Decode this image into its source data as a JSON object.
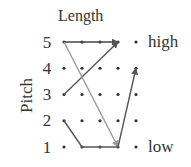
{
  "diagram": {
    "title": "Length",
    "y_axis_label": "Pitch",
    "y_ticks": [
      "5",
      "4",
      "3",
      "2",
      "1"
    ],
    "high_label": "high",
    "low_label": "low",
    "grid": {
      "columns": 5,
      "rows": 5
    },
    "paths": [
      {
        "name": "path-top-row",
        "color": "#444444",
        "points": [
          [
            1,
            5
          ],
          [
            2,
            5
          ],
          [
            3,
            5
          ],
          [
            4,
            5
          ]
        ],
        "arrow": true
      },
      {
        "name": "path-3-to-4-5",
        "color": "#555555",
        "points": [
          [
            1,
            3
          ],
          [
            4,
            5
          ]
        ],
        "arrow": true
      },
      {
        "name": "path-5-to-4-1",
        "color": "#999999",
        "points": [
          [
            1,
            5
          ],
          [
            4,
            1
          ]
        ],
        "arrow": true
      },
      {
        "name": "path-2-low-up",
        "color": "#555555",
        "points": [
          [
            1,
            2
          ],
          [
            2,
            1
          ],
          [
            3,
            1
          ],
          [
            4,
            1
          ],
          [
            5,
            4
          ]
        ],
        "arrow": true
      }
    ]
  }
}
